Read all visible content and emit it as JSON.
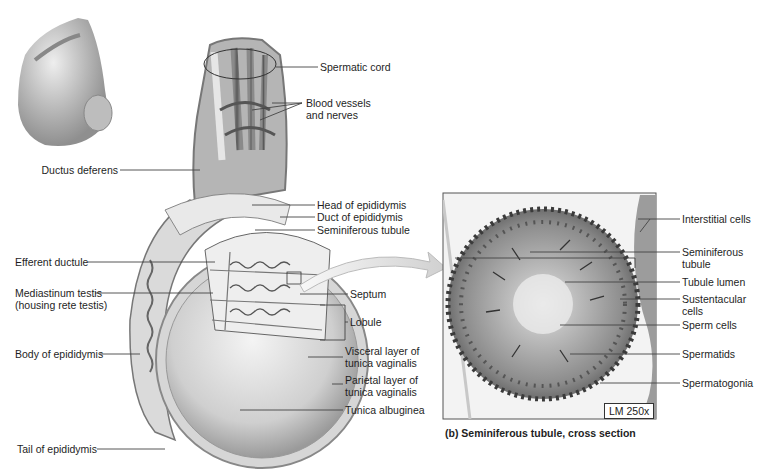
{
  "figure": {
    "panel_b_caption": "(b) Seminiferous tubule, cross section",
    "scale_label": "LM 250x",
    "colors": {
      "background": "#ffffff",
      "label_text": "#1e1e1e",
      "leader_line": "#444444",
      "tissue_light": "#e4e4e4",
      "tissue_mid": "#b8b8b8",
      "tissue_dark": "#6a6a6a",
      "nuclei": "#2f2f2f"
    }
  },
  "labels_left": {
    "ductus_deferens": "Ductus deferens",
    "efferent_ductule": "Efferent ductule",
    "mediastinum_line1": "Mediastinum testis",
    "mediastinum_line2": "(housing rete testis)",
    "body_of_epididymis": "Body of epididymis",
    "tail_of_epididymis": "Tail of epididymis"
  },
  "labels_center": {
    "spermatic_cord": "Spermatic cord",
    "blood_vessels_line1": "Blood vessels",
    "blood_vessels_line2": "and nerves",
    "head_of_epididymis": "Head of epididymis",
    "duct_of_epididymis": "Duct of epididymis",
    "seminiferous_tubule": "Seminiferous tubule",
    "septum": "Septum",
    "lobule": "Lobule",
    "visceral_line1": "Visceral layer of",
    "visceral_line2": "tunica vaginalis",
    "parietal_line1": "Parietal layer of",
    "parietal_line2": "tunica vaginalis",
    "tunica_albuginea": "Tunica albuginea"
  },
  "labels_right": {
    "interstitial_cells": "Interstitial cells",
    "seminiferous_line1": "Seminiferous",
    "seminiferous_line2": "tubule",
    "tubule_lumen": "Tubule lumen",
    "sustentacular_line1": "Sustentacular",
    "sustentacular_line2": "cells",
    "sperm_cells": "Sperm cells",
    "spermatids": "Spermatids",
    "spermatogonia": "Spermatogonia"
  }
}
